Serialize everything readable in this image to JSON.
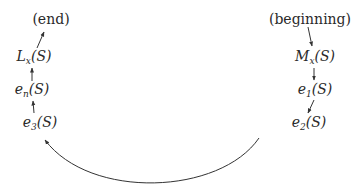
{
  "diagram": {
    "type": "flow-cycle",
    "nodes": {
      "end": {
        "text": "(end)"
      },
      "lx": {
        "base": "L",
        "sub": "x",
        "arg": "(S)"
      },
      "en": {
        "base": "e",
        "sub": "n",
        "arg": "(S)"
      },
      "e3": {
        "base": "e",
        "sub": "3",
        "arg": "(S)"
      },
      "beginning": {
        "text": "(beginning)"
      },
      "mx": {
        "base": "M",
        "sub": "x",
        "arg": "(S)"
      },
      "e1": {
        "base": "e",
        "sub": "1",
        "arg": "(S)"
      },
      "e2": {
        "base": "e",
        "sub": "2",
        "arg": "(S)"
      }
    },
    "edges": [
      [
        "beginning",
        "mx"
      ],
      [
        "mx",
        "e1"
      ],
      [
        "e1",
        "e2"
      ],
      [
        "e2",
        "e3"
      ],
      [
        "e3",
        "en"
      ],
      [
        "en",
        "lx"
      ],
      [
        "lx",
        "end"
      ]
    ],
    "line_color": "#333333"
  }
}
